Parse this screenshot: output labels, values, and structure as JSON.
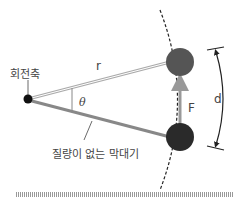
{
  "diagram": {
    "labels": {
      "pivot": "회전축",
      "radius": "r",
      "angle": "θ",
      "force": "F",
      "distance": "d",
      "rod": "질량이 없는 막대기"
    },
    "colors": {
      "pivot": "#111111",
      "mass_top": "#555555",
      "mass_bottom": "#2a2a2a",
      "rod": "#888888",
      "arrow": "#999999",
      "text": "#444444",
      "baseline": "#aaaaaa"
    }
  }
}
